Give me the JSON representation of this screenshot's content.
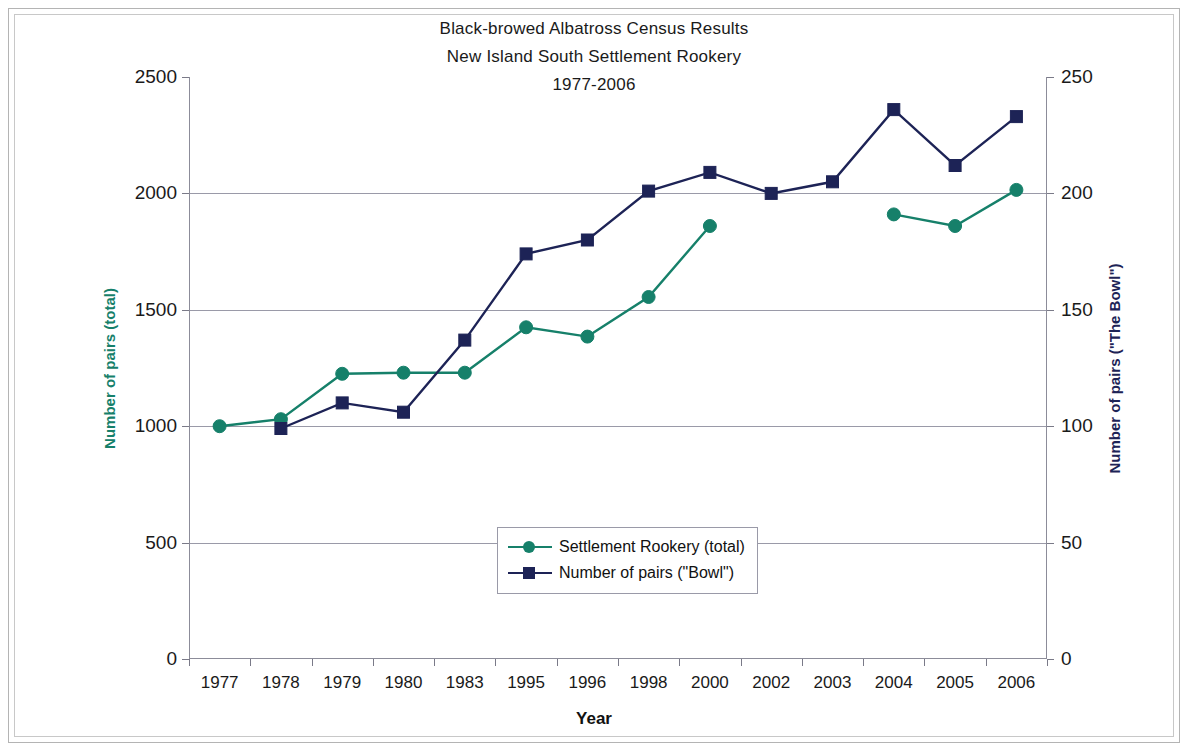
{
  "chart_data": {
    "type": "line",
    "title": "Black-browed Albatross Census Results",
    "subtitle": "New Island South Settlement Rookery",
    "subtitle2": "1977-2006",
    "title_lines": [
      "Black-browed Albatross Census Results",
      "New Island South Settlement Rookery",
      "1977-2006"
    ],
    "xlabel": "Year",
    "ylabel": "Number of pairs (total)",
    "ylabel_right": "Number of pairs (\"The Bowl\")",
    "categories": [
      "1977",
      "1978",
      "1979",
      "1980",
      "1983",
      "1995",
      "1996",
      "1998",
      "2000",
      "2002",
      "2003",
      "2004",
      "2005",
      "2006"
    ],
    "ylim": [
      0,
      2500
    ],
    "yticks": [
      0,
      500,
      1000,
      1500,
      2000,
      2500
    ],
    "ytick_labels": [
      "0",
      "500",
      "1000",
      "1500",
      "2000",
      "2500"
    ],
    "ylim_right": [
      0,
      250
    ],
    "yticks_right": [
      0,
      50,
      100,
      150,
      200,
      250
    ],
    "ytick_labels_right": [
      "0",
      "50",
      "100",
      "150",
      "200",
      "250"
    ],
    "grid": true,
    "legend_position": "center",
    "series": [
      {
        "name": "Settlement Rookery (total)",
        "axis": "left",
        "color": "#16806a",
        "marker": "circle",
        "values": [
          1000,
          1030,
          1225,
          1230,
          1230,
          1425,
          1385,
          1555,
          1860,
          null,
          null,
          1910,
          1860,
          2015
        ]
      },
      {
        "name": "Number of pairs (\"Bowl\")",
        "axis": "right",
        "color": "#1d2356",
        "marker": "square",
        "values": [
          null,
          99,
          110,
          106,
          137,
          174,
          180,
          201,
          209,
          200,
          205,
          236,
          212,
          233
        ]
      }
    ]
  },
  "legend": {
    "items": [
      {
        "label": "Settlement Rookery (total)",
        "color": "#16806a",
        "marker": "circle"
      },
      {
        "label": "Number of pairs (\"Bowl\")",
        "color": "#1d2356",
        "marker": "square"
      }
    ]
  },
  "colors": {
    "series_teal": "#16806a",
    "series_navy": "#1d2356",
    "grid": "#9a9aa8",
    "frame": "#b4b4b4",
    "text": "#1a1a1a"
  }
}
